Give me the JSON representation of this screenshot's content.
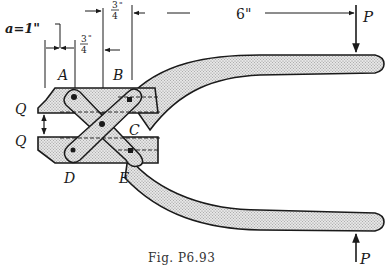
{
  "figure": {
    "caption": "Fig. P6.93",
    "labels": {
      "A": "A",
      "B": "B",
      "C": "C",
      "D": "D",
      "E": "E",
      "Q_top": "Q",
      "Q_bottom": "Q",
      "P_top": "P",
      "P_bottom": "P"
    },
    "dimensions": {
      "a": "a=1\"",
      "three_quarter_1_num": "3",
      "three_quarter_1_den": "4",
      "three_quarter_1_unit": "\"",
      "three_quarter_2_num": "3",
      "three_quarter_2_den": "4",
      "three_quarter_2_unit": "\"",
      "six": "6\""
    },
    "colors": {
      "ink": "#1a1a1a",
      "hatch_fill": "#d8d8d8"
    }
  }
}
